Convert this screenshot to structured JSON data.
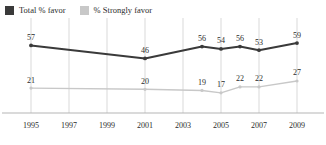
{
  "legend": {
    "entries": [
      {
        "label": "Total % favor",
        "color": "#3a3a3a",
        "swatch": "legend-swatch-dark"
      },
      {
        "label": "% Strongly favor",
        "color": "#c8c8c8",
        "swatch": "legend-swatch-light"
      }
    ]
  },
  "chart_data": {
    "type": "line",
    "title": "",
    "subtitle": "",
    "xlabel": "",
    "ylabel": "",
    "grid": "vertical",
    "legend_position": "top-left",
    "xlim": [
      1994,
      2010
    ],
    "ylim": [
      0,
      70
    ],
    "tick_labels": [
      "1995",
      "1997",
      "1999",
      "2001",
      "2003",
      "2005",
      "2007",
      "2009"
    ],
    "tick_values": [
      1995,
      1997,
      1999,
      2001,
      2003,
      2005,
      2007,
      2009
    ],
    "series": [
      {
        "name": "Total % favor",
        "color": "#3a3a3a",
        "x": [
          1995,
          2001,
          2004,
          2005,
          2006,
          2007,
          2009
        ],
        "values": [
          57,
          46,
          56,
          54,
          56,
          53,
          59
        ],
        "labels": [
          "57",
          "46",
          "56",
          "54",
          "56",
          "53",
          "59"
        ]
      },
      {
        "name": "% Strongly favor",
        "color": "#c8c8c8",
        "x": [
          1995,
          2001,
          2004,
          2005,
          2006,
          2007,
          2009
        ],
        "values": [
          21,
          20,
          19,
          17,
          22,
          22,
          27
        ],
        "labels": [
          "21",
          "20",
          "19",
          "17",
          "22",
          "22",
          "27"
        ]
      }
    ]
  },
  "colors": {
    "dark_series": "#3a3a3a",
    "light_series": "#c8c8c8",
    "gridline": "#d9d9d9",
    "axis": "#b5b5b5",
    "text": "#2b2b2b",
    "background": "#ffffff"
  }
}
